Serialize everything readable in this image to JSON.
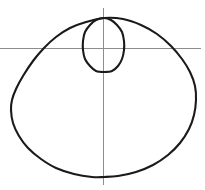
{
  "figure": {
    "title": "",
    "background_color": "#ffffff",
    "width": 205,
    "height": 190
  },
  "axes": {
    "horizontal": {
      "label": "",
      "color": "#8d8d8d",
      "x_start": 0,
      "x_end": 201,
      "y": 48
    },
    "vertical": {
      "label": "",
      "color": "#8d8d8d",
      "x": 103,
      "y_start": 8,
      "y_end": 185
    },
    "origin": {
      "x": 103,
      "y": 48
    },
    "tick_labels": [],
    "grid": false
  },
  "chart_data": {
    "type": "line",
    "title": "",
    "subtitle": "",
    "xlabel": "",
    "ylabel": "",
    "plot_kind": "polar",
    "curve_name": "limacon-with-inner-loop",
    "equation": "r = a + b*sin(theta)",
    "parameters": {
      "a": 1,
      "b": 1.9
    },
    "orientation": "inner loop opens upward",
    "stroke_color": "#1a1a1a",
    "stroke_width": 2.1,
    "legend": [],
    "annotations": [],
    "xlim": [
      0,
      205
    ],
    "ylim": [
      0,
      190
    ],
    "node_point": {
      "x": 104,
      "y": 18
    },
    "outer_extents": {
      "left_x": 11,
      "right_x": 196,
      "top_y": 18,
      "bottom_y": 177
    },
    "inner_loop_extents": {
      "left_x": 83,
      "right_x": 124,
      "top_y": 18,
      "bottom_y": 72
    },
    "series": [
      {
        "name": "outer-curve",
        "closed": true,
        "points": [
          [
            104,
            18
          ],
          [
            86,
            22
          ],
          [
            70,
            28
          ],
          [
            56,
            37
          ],
          [
            44,
            48
          ],
          [
            33,
            61
          ],
          [
            23,
            76
          ],
          [
            16,
            89
          ],
          [
            12,
            100
          ],
          [
            11,
            110
          ],
          [
            13,
            123
          ],
          [
            19,
            136
          ],
          [
            28,
            148
          ],
          [
            41,
            159
          ],
          [
            56,
            168
          ],
          [
            74,
            174
          ],
          [
            92,
            177
          ],
          [
            104,
            177
          ],
          [
            118,
            176
          ],
          [
            136,
            172
          ],
          [
            153,
            165
          ],
          [
            168,
            155
          ],
          [
            180,
            143
          ],
          [
            189,
            129
          ],
          [
            194,
            115
          ],
          [
            196,
            100
          ],
          [
            195,
            86
          ],
          [
            190,
            72
          ],
          [
            182,
            59
          ],
          [
            171,
            46
          ],
          [
            157,
            34
          ],
          [
            141,
            25
          ],
          [
            123,
            19
          ],
          [
            104,
            18
          ]
        ]
      },
      {
        "name": "inner-loop",
        "closed": true,
        "points": [
          [
            104,
            18
          ],
          [
            96,
            20
          ],
          [
            90,
            25
          ],
          [
            85,
            32
          ],
          [
            83,
            41
          ],
          [
            83,
            50
          ],
          [
            85,
            59
          ],
          [
            90,
            66
          ],
          [
            96,
            71
          ],
          [
            104,
            72
          ],
          [
            112,
            71
          ],
          [
            118,
            66
          ],
          [
            122,
            59
          ],
          [
            124,
            50
          ],
          [
            124,
            41
          ],
          [
            122,
            32
          ],
          [
            117,
            25
          ],
          [
            111,
            20
          ],
          [
            104,
            18
          ]
        ]
      }
    ]
  }
}
